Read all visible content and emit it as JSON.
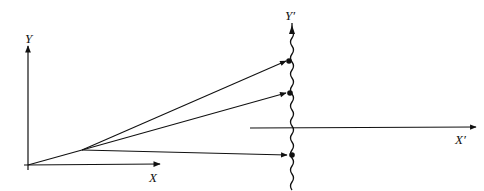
{
  "diagram": {
    "labels": {
      "y_axis": "Y",
      "x_axis": "X",
      "y_prime_axis": "Y′",
      "x_prime_axis": "X′"
    },
    "colors": {
      "ink": "#111111",
      "background": "#ffffff"
    }
  }
}
